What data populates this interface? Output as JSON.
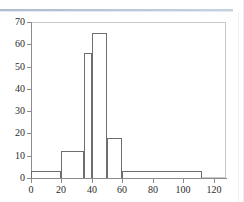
{
  "window": {
    "divider": "top-rule",
    "accent_color": "#aebcd1"
  },
  "chart_data": {
    "type": "bar",
    "subtype": "histogram",
    "title": "",
    "xlabel": "",
    "ylabel": "",
    "xlim": [
      0,
      128
    ],
    "ylim": [
      0,
      70
    ],
    "grid": false,
    "legend": null,
    "axis_color": "#8c8c8c",
    "bar_fill": "#ffffff",
    "bar_edge": "#6e6e6e",
    "xticks": [
      0,
      20,
      40,
      60,
      80,
      100,
      120
    ],
    "xtick_labels": [
      "0",
      "20",
      "40",
      "60",
      "80",
      "100",
      "120"
    ],
    "yticks": [
      0,
      10,
      20,
      30,
      40,
      50,
      60,
      70
    ],
    "ytick_labels": [
      "0",
      "10",
      "20",
      "30",
      "40",
      "50",
      "60",
      "70"
    ],
    "bins": [
      {
        "x0": 0,
        "x1": 20,
        "value": 3
      },
      {
        "x0": 20,
        "x1": 35,
        "value": 12
      },
      {
        "x0": 35,
        "x1": 40,
        "value": 56
      },
      {
        "x0": 40,
        "x1": 50,
        "value": 65
      },
      {
        "x0": 50,
        "x1": 60,
        "value": 18
      },
      {
        "x0": 60,
        "x1": 112,
        "value": 3
      }
    ]
  }
}
